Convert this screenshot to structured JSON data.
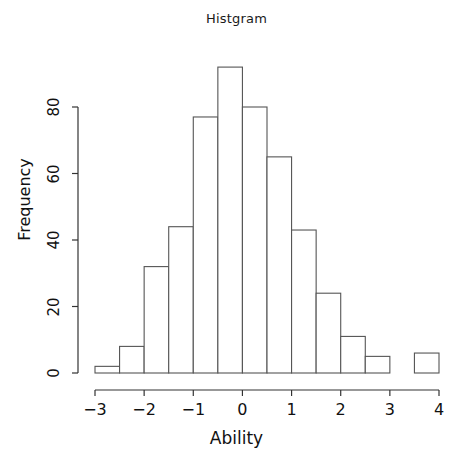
{
  "chart_data": {
    "type": "bar",
    "title": "Histgram",
    "xlabel": "Ability",
    "ylabel": "Frequency",
    "categories": [
      "-3 to -2.5",
      "-2.5 to -2",
      "-2 to -1.5",
      "-1.5 to -1",
      "-1 to -0.5",
      "-0.5 to 0",
      "0 to 0.5",
      "0.5 to 1",
      "1 to 1.5",
      "1.5 to 2",
      "2 to 2.5",
      "2.5 to 3",
      "3 to 3.5",
      "3.5 to 4"
    ],
    "bin_edges": [
      -3,
      -2.5,
      -2,
      -1.5,
      -1,
      -0.5,
      0,
      0.5,
      1,
      1.5,
      2,
      2.5,
      3,
      3.5,
      4
    ],
    "bin_width": 0.5,
    "values": [
      2,
      8,
      32,
      44,
      77,
      92,
      80,
      65,
      43,
      24,
      11,
      5,
      0,
      6
    ],
    "xlim": [
      -3,
      4
    ],
    "ylim": [
      0,
      92
    ],
    "xticks": [
      -3,
      -2,
      -1,
      0,
      1,
      2,
      3,
      4
    ],
    "xtick_labels": [
      "−3",
      "−2",
      "−1",
      "0",
      "1",
      "2",
      "3",
      "4"
    ],
    "yticks": [
      0,
      20,
      40,
      60,
      80
    ],
    "ytick_labels": [
      "0",
      "20",
      "40",
      "60",
      "80"
    ],
    "grid": false,
    "legend": false,
    "bar_fill": "#ffffff",
    "bar_stroke": "#555555",
    "axis_color": "#333333",
    "total_count": 489
  }
}
